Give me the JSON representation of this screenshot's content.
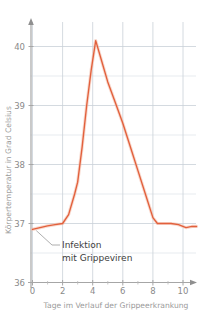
{
  "chart_data": {
    "type": "line",
    "title": "",
    "xlabel": "Tage im Verlauf der Grippeerkrankung",
    "ylabel": "Körpertemperatur in Grad Celsius",
    "xlim": [
      0,
      10.9
    ],
    "ylim": [
      36,
      40.45
    ],
    "grid": true,
    "legend": null,
    "x_ticks_major": [
      0,
      2,
      4,
      6,
      8,
      10
    ],
    "x_tick_labels": [
      "0",
      "2",
      "4",
      "6",
      "8",
      "10"
    ],
    "x_ticks_minor": [
      1,
      3,
      5,
      7,
      9
    ],
    "y_ticks_major": [
      36,
      37,
      38,
      39,
      40
    ],
    "y_tick_labels": [
      "36",
      "37",
      "38",
      "39",
      "40"
    ],
    "y_ticks_minor": [
      36.5,
      37.5,
      38.5,
      39.5
    ],
    "series": [
      {
        "name": "Körpertemperatur",
        "color": "#e2603c",
        "x": [
          0,
          0.5,
          1.0,
          1.5,
          2.0,
          2.4,
          2.8,
          3.0,
          3.3,
          3.6,
          3.9,
          4.2,
          4.6,
          5.0,
          5.5,
          6.0,
          6.5,
          7.0,
          7.5,
          8.0,
          8.3,
          8.7,
          9.2,
          9.7,
          10.2,
          10.6,
          10.9
        ],
        "y": [
          36.9,
          36.93,
          36.96,
          36.98,
          37.0,
          37.15,
          37.5,
          37.7,
          38.3,
          39.0,
          39.6,
          40.1,
          39.75,
          39.4,
          39.05,
          38.7,
          38.3,
          37.9,
          37.5,
          37.1,
          37.0,
          37.0,
          37.0,
          36.98,
          36.93,
          36.95,
          36.95
        ]
      }
    ],
    "annotations": [
      {
        "name": "infection-annotation",
        "line1": "Infektion",
        "line2": "mit Grippeviren",
        "points_to_x": 0.25,
        "points_to_y": 36.88
      }
    ]
  },
  "axes": {
    "y_axis_title": "Körpertemperatur in Grad Celsius",
    "x_axis_title": "Tage im Verlauf der Grippeerkrankung",
    "y_labels": {
      "t40": "40",
      "t39": "39",
      "t38": "38",
      "t37": "37",
      "t36": "36"
    },
    "x_labels": {
      "t0": "0",
      "t2": "2",
      "t4": "4",
      "t6": "6",
      "t8": "8",
      "t10": "10"
    }
  },
  "annotation": {
    "line1": "Infektion",
    "line2": "mit Grippeviren"
  },
  "colors": {
    "curve": "#e2603c",
    "grid": "#c9d0d8",
    "axis": "#a6a6a6",
    "tick_text": "#8a8a8a",
    "title_text": "#9a9a9a",
    "annotation_text": "#3c3c3c",
    "background": "#ffffff"
  }
}
